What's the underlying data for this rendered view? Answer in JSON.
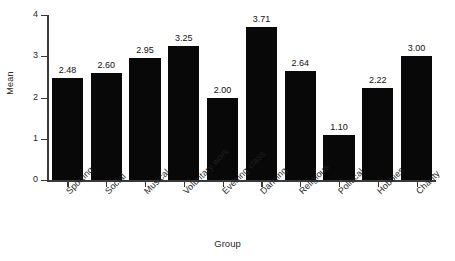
{
  "chart_data": {
    "type": "bar",
    "title": "",
    "subtitle": "",
    "xlabel": "Group",
    "ylabel": "Mean",
    "categories": [
      "Sporting",
      "Social",
      "Musical",
      "Voluntary work",
      "Evening class",
      "Dancing",
      "Religious",
      "Political",
      "Hobbies",
      "Charity"
    ],
    "values": [
      2.48,
      2.6,
      2.95,
      3.25,
      2.0,
      3.71,
      2.64,
      1.1,
      2.22,
      3.0
    ],
    "value_labels": [
      "2.48",
      "2.60",
      "2.95",
      "3.25",
      "2.00",
      "3.71",
      "2.64",
      "1.10",
      "2.22",
      "3.00"
    ],
    "ylim": [
      0,
      4
    ],
    "ytick_labels": [
      "0",
      "1",
      "2",
      "3",
      "4"
    ],
    "ytick_values": [
      0,
      1,
      2,
      3,
      4
    ],
    "grid": false,
    "legend": "none",
    "bar_color": "#080808",
    "axis_color": "#3a3a3a",
    "background_color": "#ffffff",
    "xtick_label_rotation": -45
  }
}
